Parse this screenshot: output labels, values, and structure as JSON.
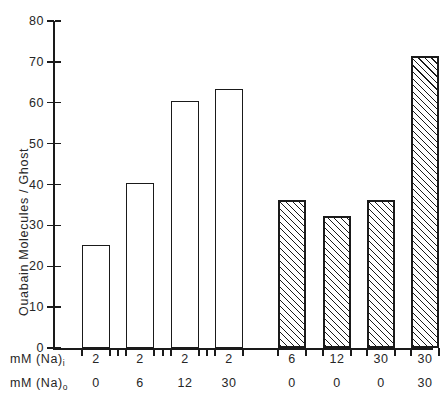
{
  "chart_data": {
    "type": "bar",
    "title": "",
    "xlabel": "",
    "ylabel": "Ouabain Molecules / Ghost",
    "ylim": [
      0,
      80
    ],
    "ytick_values": [
      0,
      10,
      20,
      30,
      40,
      50,
      60,
      70,
      80
    ],
    "ytick_labels": [
      "0",
      "10",
      "20",
      "30",
      "40",
      "50",
      "60",
      "70",
      "80"
    ],
    "grid": false,
    "legend": false,
    "categories": [
      "1",
      "2",
      "3",
      "4",
      "5",
      "6",
      "7",
      "8"
    ],
    "values": [
      25.2,
      40.3,
      60.5,
      63.4,
      36.2,
      32.2,
      36.1,
      71.5
    ],
    "bar_styles": [
      "open",
      "open",
      "open",
      "open",
      "hatched",
      "hatched",
      "hatched",
      "hatched"
    ],
    "bars": [
      {
        "na_in": "2",
        "na_out": "0",
        "value": 25.2,
        "style": "open"
      },
      {
        "na_in": "2",
        "na_out": "6",
        "value": 40.3,
        "style": "open"
      },
      {
        "na_in": "2",
        "na_out": "12",
        "value": 60.5,
        "style": "open"
      },
      {
        "na_in": "2",
        "na_out": "30",
        "value": 63.4,
        "style": "open"
      },
      {
        "na_in": "6",
        "na_out": "0",
        "value": 36.2,
        "style": "hatched"
      },
      {
        "na_in": "12",
        "na_out": "0",
        "value": 32.2,
        "style": "hatched"
      },
      {
        "na_in": "30",
        "na_out": "0",
        "value": 36.1,
        "style": "hatched"
      },
      {
        "na_in": "30",
        "na_out": "30",
        "value": 71.5,
        "style": "hatched"
      }
    ],
    "x_label_rows": [
      {
        "title_prefix": "mM  (Na)",
        "title_sub": "i",
        "values": [
          "2",
          "2",
          "2",
          "2",
          "6",
          "12",
          "30",
          "30"
        ]
      },
      {
        "title_prefix": "mM  (Na)",
        "title_sub": "o",
        "values": [
          "0",
          "6",
          "12",
          "30",
          "0",
          "0",
          "0",
          "30"
        ]
      }
    ],
    "colors": {
      "axis": "#1a1a1a",
      "bar_edge": "#1a1a1a",
      "bar_open_fill": "#ffffff",
      "hatch": "#1a1a1a",
      "background": "#ffffff"
    }
  }
}
